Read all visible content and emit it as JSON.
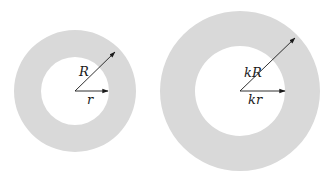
{
  "diagram": {
    "fill_color": "#d9d9d9",
    "line_color": "#1a1a1a",
    "annuli": [
      {
        "name": "small-annulus",
        "cx": 75,
        "cy": 91,
        "outer_r": 61,
        "inner_r": 34,
        "outer_label": "R",
        "inner_label": "r",
        "outer_arrow_tip": [
          115,
          52
        ],
        "inner_arrow_tip": [
          108,
          91
        ],
        "outer_label_pos": [
          79,
          76
        ],
        "inner_label_pos": [
          87,
          104
        ]
      },
      {
        "name": "large-annulus",
        "cx": 240,
        "cy": 91,
        "outer_r": 80,
        "inner_r": 45,
        "outer_label": "kR",
        "inner_label": "kr",
        "outer_arrow_tip": [
          295,
          38
        ],
        "inner_arrow_tip": [
          285,
          91
        ],
        "outer_label_pos": [
          244,
          77
        ],
        "inner_label_pos": [
          248,
          104
        ]
      }
    ]
  }
}
